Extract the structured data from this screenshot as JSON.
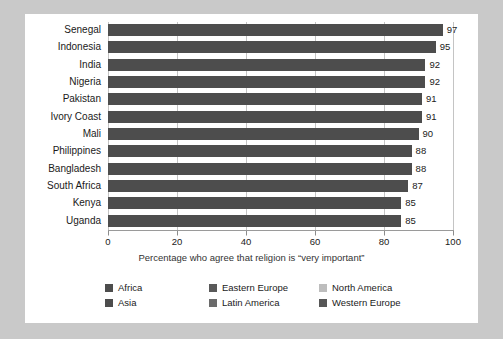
{
  "chart_data": {
    "type": "bar",
    "orientation": "horizontal",
    "title": "",
    "xlabel": "Percentage who agree that religion is “very important”",
    "ylabel": "",
    "xlim": [
      0,
      100
    ],
    "xticks": [
      0,
      20,
      40,
      60,
      80,
      100
    ],
    "grid": true,
    "legend_position": "bottom",
    "categories": [
      "Senegal",
      "Indonesia",
      "India",
      "Nigeria",
      "Pakistan",
      "Ivory Coast",
      "Mali",
      "Philippines",
      "Bangladesh",
      "South Africa",
      "Kenya",
      "Uganda"
    ],
    "values": [
      97,
      95,
      92,
      92,
      91,
      91,
      90,
      88,
      88,
      87,
      85,
      85
    ],
    "bar_color": "#4d4d4d",
    "legend": [
      {
        "label": "Africa",
        "color": "#4d4d4d"
      },
      {
        "label": "Eastern Europe",
        "color": "#595959"
      },
      {
        "label": "North America",
        "color": "#bdbdbd"
      },
      {
        "label": "Asia",
        "color": "#4d4d4d"
      },
      {
        "label": "Latin America",
        "color": "#6b6b6b"
      },
      {
        "label": "Western Europe",
        "color": "#575757"
      }
    ]
  },
  "colors": {
    "page_background": "#c9c9c9",
    "card_background": "#ffffff",
    "bar": "#4d4d4d",
    "gridline": "#c4c4c4",
    "axis": "#9a9a9a",
    "text": "#1a1a1a"
  }
}
